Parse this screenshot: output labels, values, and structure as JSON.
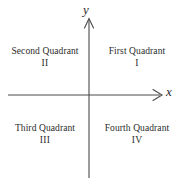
{
  "figure": {
    "background_color": "#ffffff",
    "axis_color": "#4a4a4a",
    "text_color": "#2b2b2b"
  },
  "axes": {
    "x": {
      "label": "x",
      "arrow": "arrow-right",
      "start_px": 8,
      "end_px": 162,
      "position_y_px": 95
    },
    "y": {
      "label": "y",
      "arrow": "arrow-up",
      "start_px": 178,
      "end_px": 18,
      "position_x_px": 89
    },
    "origin_px": [
      89,
      95
    ]
  },
  "quadrants": [
    {
      "id": "first",
      "name": "First Quadrant",
      "numeral": "I",
      "position": "top-right"
    },
    {
      "id": "second",
      "name": "Second Quadrant",
      "numeral": "II",
      "position": "top-left"
    },
    {
      "id": "third",
      "name": "Third Quadrant",
      "numeral": "III",
      "position": "bottom-left"
    },
    {
      "id": "fourth",
      "name": "Fourth Quadrant",
      "numeral": "IV",
      "position": "bottom-right"
    }
  ]
}
